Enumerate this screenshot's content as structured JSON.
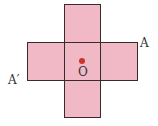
{
  "figure": {
    "shape": "cross made of five unit squares",
    "fill_color": "#f1b8c6",
    "stroke_color": "#3a2a2e",
    "center_point_color": "#c8352a",
    "labels": {
      "center": "O",
      "right_top_corner": "A",
      "left_bottom_corner": "A′"
    }
  }
}
